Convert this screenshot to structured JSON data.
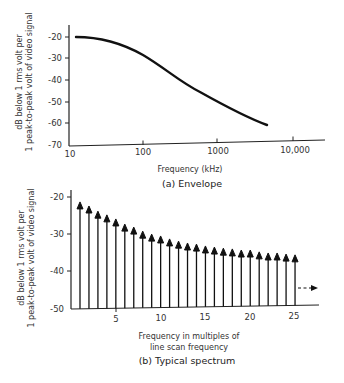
{
  "chart_data": [
    {
      "type": "line",
      "title": "(a) Envelope",
      "xlabel": "Frequency (kHz)",
      "ylabel_lines": [
        "dB below 1 rms volt per",
        "1 peak-to-peak volt of video signal"
      ],
      "xscale": "log",
      "xticks": [
        10,
        100,
        1000,
        10000
      ],
      "xtick_labels": [
        "10",
        "100",
        "1000",
        "10,000"
      ],
      "yticks": [
        -20,
        -30,
        -40,
        -50,
        -60,
        -70
      ],
      "ytick_labels": [
        "-20",
        "-30",
        "-40",
        "-50",
        "-60",
        "-70"
      ],
      "ylim": [
        -70,
        -17
      ],
      "xlim": [
        10,
        27000
      ],
      "grid": false,
      "x": [
        12,
        20,
        40,
        70,
        100,
        200,
        400,
        700,
        1000,
        2000,
        4500
      ],
      "y": [
        -20,
        -21,
        -23.5,
        -26.5,
        -29,
        -35.5,
        -42,
        -47,
        -50,
        -55,
        -60
      ]
    },
    {
      "type": "bar",
      "style": "arrow-stems",
      "title": "(b) Typical spectrum",
      "xlabel_lines": [
        "Frequency in multiples of",
        "line scan frequency"
      ],
      "ylabel_lines": [
        "dB below 1 rms volt per",
        "1 peak-to-peak volt of video signal"
      ],
      "xticks": [
        5,
        10,
        15,
        20,
        25
      ],
      "xtick_labels": [
        "5",
        "10",
        "15",
        "20",
        "25"
      ],
      "yticks": [
        -20,
        -30,
        -40,
        -50
      ],
      "ytick_labels": [
        "-20",
        "-30",
        "-40",
        "-50"
      ],
      "ylim": [
        -50,
        -18
      ],
      "grid": false,
      "categories": [
        1,
        2,
        3,
        4,
        5,
        6,
        7,
        8,
        9,
        10,
        11,
        12,
        13,
        14,
        15,
        16,
        17,
        18,
        19,
        20,
        21,
        22,
        23,
        24,
        25
      ],
      "values": [
        -21.6,
        -22.7,
        -24.1,
        -25.1,
        -26.2,
        -27.6,
        -28.4,
        -29.5,
        -30.3,
        -30.8,
        -31.6,
        -32.2,
        -32.7,
        -33.0,
        -33.5,
        -33.8,
        -34.1,
        -34.3,
        -34.6,
        -34.6,
        -35.1,
        -35.4,
        -35.4,
        -35.7,
        -35.9
      ],
      "annotation": "dashed arrow continuing to right beyond harmonic 25"
    }
  ],
  "top": {
    "ylabel_1": "dB below 1 rms volt per",
    "ylabel_2": "1 peak-to-peak volt of video signal",
    "yticks": [
      "-20",
      "-30",
      "-40",
      "-50",
      "-60",
      "-70"
    ],
    "xticks": [
      "10",
      "100",
      "1000",
      "10,000"
    ],
    "xlabel": "Frequency (kHz)",
    "caption": "(a)  Envelope"
  },
  "bottom": {
    "ylabel_1": "dB below 1 rms volt per",
    "ylabel_2": "1 peak-to-peak volt of video signal",
    "yticks": [
      "-20",
      "-30",
      "-40",
      "-50"
    ],
    "xticks": [
      "5",
      "10",
      "15",
      "20",
      "25"
    ],
    "xlabel_1": "Frequency in multiples of",
    "xlabel_2": "line scan frequency",
    "caption": "(b)  Typical spectrum"
  }
}
